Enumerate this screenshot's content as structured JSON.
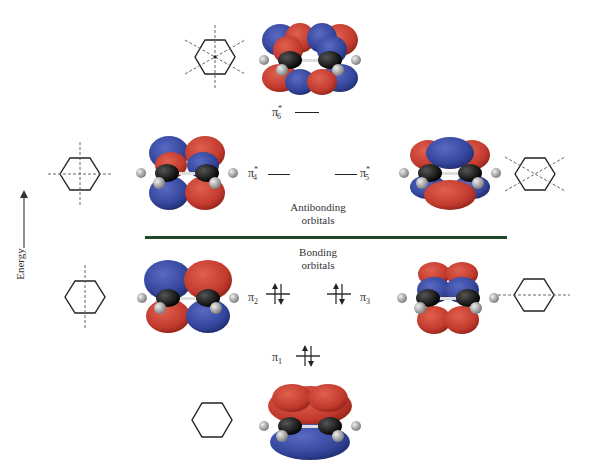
{
  "axis": {
    "label": "Energy",
    "direction": "up"
  },
  "divider": {
    "color": "#1e4a2a"
  },
  "sections": {
    "antibonding": {
      "line1": "Antibonding",
      "line2": "orbitals"
    },
    "bonding": {
      "line1": "Bonding",
      "line2": "orbitals"
    }
  },
  "orbitals": [
    {
      "id": "pi6",
      "symbol": "π",
      "sub": "6",
      "sup": "*",
      "electrons": 0,
      "nodal_planes": 3
    },
    {
      "id": "pi4",
      "symbol": "π",
      "sub": "4",
      "sup": "*",
      "electrons": 0,
      "nodal_planes": 2
    },
    {
      "id": "pi5",
      "symbol": "π",
      "sub": "5",
      "sup": "*",
      "electrons": 0,
      "nodal_planes": 2
    },
    {
      "id": "pi2",
      "symbol": "π",
      "sub": "2",
      "sup": "",
      "electrons": 2,
      "nodal_planes": 1
    },
    {
      "id": "pi3",
      "symbol": "π",
      "sub": "3",
      "sup": "",
      "electrons": 2,
      "nodal_planes": 1
    },
    {
      "id": "pi1",
      "symbol": "π",
      "sub": "1",
      "sup": "",
      "electrons": 2,
      "nodal_planes": 0
    }
  ],
  "colors": {
    "lobe_positive": "#c23a2e",
    "lobe_negative": "#33449a",
    "carbon": "#111111",
    "hydrogen": "#9a9a9a"
  }
}
